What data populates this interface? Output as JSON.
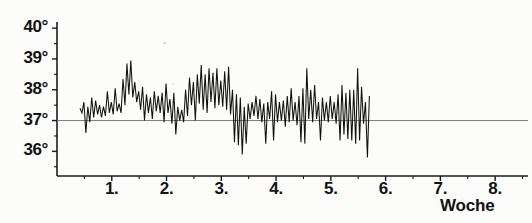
{
  "chart_data": {
    "type": "line",
    "title": "",
    "subtitle": "",
    "xlabel": "Woche",
    "ylabel": "",
    "grid": false,
    "legend": null,
    "annotations": [],
    "reference_lines": [
      {
        "axis": "y",
        "value": 37,
        "label": "37°"
      }
    ],
    "xlim": [
      0.0,
      8.6
    ],
    "ylim": [
      35.2,
      40.2
    ],
    "ytick_values": [
      36,
      37,
      38,
      39,
      40
    ],
    "ytick_labels": [
      "36°",
      "37°",
      "38°",
      "39°",
      "40°"
    ],
    "yminor_ticks": [
      35.5,
      36.5,
      37.5,
      38.5,
      39.5
    ],
    "xtick_values": [
      1,
      2,
      3,
      4,
      5,
      6,
      7,
      8
    ],
    "xtick_labels": [
      "1.",
      "2.",
      "3.",
      "4.",
      "5.",
      "6.",
      "7.",
      "8."
    ],
    "xminor_ticks": [
      0.5,
      1.5,
      2.5,
      3.5,
      4.5,
      5.5,
      6.5,
      7.5,
      8.5
    ],
    "series": [
      {
        "name": "Temperatur",
        "color": "#111111",
        "x_start": 0.42,
        "x_step": 0.0357,
        "values": [
          37.4,
          37.25,
          37.6,
          36.6,
          37.45,
          36.95,
          37.75,
          37.1,
          37.65,
          37.2,
          37.5,
          37.1,
          37.45,
          37.15,
          37.95,
          37.25,
          37.6,
          37.2,
          38.05,
          37.3,
          37.55,
          37.25,
          38.35,
          37.5,
          38.85,
          37.85,
          38.95,
          37.75,
          38.25,
          37.6,
          37.95,
          37.35,
          38.1,
          37.0,
          37.85,
          37.25,
          37.75,
          37.05,
          37.95,
          37.3,
          37.8,
          37.25,
          37.9,
          36.95,
          38.2,
          37.25,
          37.7,
          36.9,
          37.9,
          36.55,
          37.45,
          37.0,
          37.35,
          36.95,
          38.0,
          37.15,
          38.4,
          37.5,
          38.25,
          37.0,
          38.5,
          37.55,
          38.8,
          37.35,
          38.5,
          37.25,
          38.7,
          37.6,
          38.55,
          37.4,
          38.7,
          37.5,
          38.3,
          37.45,
          38.6,
          37.35,
          38.75,
          37.2,
          38.0,
          36.3,
          37.85,
          36.2,
          37.75,
          35.9,
          37.45,
          36.25,
          37.55,
          37.05,
          37.6,
          37.15,
          37.8,
          37.05,
          37.7,
          36.95,
          37.55,
          36.25,
          37.6,
          37.05,
          37.95,
          36.35,
          37.85,
          36.95,
          37.6,
          37.0,
          37.65,
          36.8,
          37.8,
          36.95,
          38.05,
          37.0,
          37.6,
          36.85,
          37.8,
          36.3,
          38.05,
          36.25,
          38.7,
          37.05,
          38.0,
          36.95,
          38.15,
          37.05,
          37.6,
          36.35,
          37.75,
          37.0,
          37.6,
          36.95,
          37.8,
          37.05,
          37.6,
          36.9,
          37.85,
          36.35,
          38.15,
          36.55,
          37.9,
          36.4,
          38.0,
          36.35,
          38.0,
          36.25,
          38.7,
          36.35,
          38.1,
          36.9,
          37.6,
          35.8,
          37.8
        ]
      }
    ]
  },
  "axes": {
    "y_axis_name": "temperature-axis",
    "x_axis_name": "week-axis"
  }
}
